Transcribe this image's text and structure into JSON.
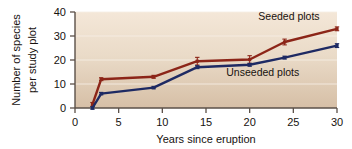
{
  "figure": {
    "name": "species-richness-line-chart",
    "background_color": "#ffffff",
    "plot_background_top_color": "#f2e4d4",
    "plot_background_bottom_color": "#d9c3ab",
    "gridline_color": "#f7efe6"
  },
  "chart_data": {
    "type": "line",
    "title": "",
    "subtitle": "",
    "xlabel": "Years since eruption",
    "ylabel": "Number of species per study plot",
    "ylabel_line1": "Number of species",
    "ylabel_line2": "per study plot",
    "xlim": [
      0,
      30
    ],
    "ylim": [
      0,
      40
    ],
    "xticks": [
      0,
      5,
      10,
      15,
      20,
      25,
      30
    ],
    "xtick_labels": [
      "0",
      "5",
      "10",
      "15",
      "20",
      "25",
      "30"
    ],
    "yticks": [
      0,
      10,
      20,
      30,
      40
    ],
    "ytick_labels": [
      "0",
      "10",
      "20",
      "30",
      "40"
    ],
    "grid": "horizontal",
    "legend_position": "inline-annotations",
    "error_bars": true,
    "x": [
      2,
      3,
      9,
      14,
      20,
      24,
      30
    ],
    "series": [
      {
        "name": "Seeded plots",
        "color": "#8c2518",
        "values": [
          1.5,
          12.0,
          13.0,
          19.5,
          20.2,
          27.5,
          33.0
        ],
        "errors": [
          0.8,
          0.6,
          0.6,
          1.6,
          1.6,
          1.2,
          0.8
        ],
        "label_x": 24.5,
        "label_y": 38.5
      },
      {
        "name": "Unseeded plots",
        "color": "#1e2a63",
        "values": [
          0.0,
          6.0,
          8.5,
          17.0,
          18.0,
          21.0,
          26.0
        ],
        "errors": [
          0.5,
          0.5,
          0.5,
          0.6,
          0.6,
          0.6,
          0.8
        ],
        "label_x": 21.5,
        "label_y": 15.0
      }
    ],
    "annotations": [
      {
        "text": "Seeded plots",
        "series": "Seeded plots"
      },
      {
        "text": "Unseeded plots",
        "series": "Unseeded plots"
      }
    ]
  }
}
